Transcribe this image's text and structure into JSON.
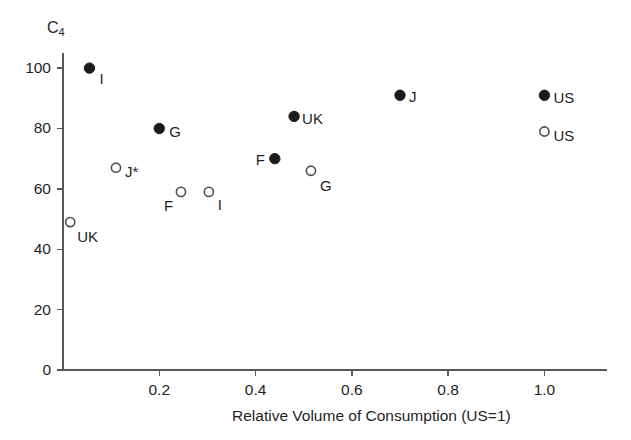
{
  "chart_data": {
    "type": "scatter",
    "title": "",
    "xlabel": "Relative Volume of Consumption (US=1)",
    "ylabel": "C4",
    "ylabel_display": "C",
    "ylabel_subscript": "4",
    "xlim": [
      0,
      1.13
    ],
    "ylim": [
      0,
      105
    ],
    "xticks": [
      0.2,
      0.4,
      0.6,
      0.8,
      1.0
    ],
    "xtick_labels": [
      "0.2",
      "0.4",
      "0.6",
      "0.8",
      "1.0"
    ],
    "yticks": [
      0,
      20,
      40,
      60,
      80,
      100
    ],
    "ytick_labels": [
      "0",
      "20",
      "40",
      "60",
      "80",
      "100"
    ],
    "grid": false,
    "legend": "none",
    "marker_styles": [
      "filled",
      "open"
    ],
    "points": [
      {
        "label": "I",
        "x": 0.055,
        "y": 100,
        "marker": "filled",
        "label_dx": 10,
        "label_dy": 3
      },
      {
        "label": "G",
        "x": 0.2,
        "y": 80,
        "marker": "filled",
        "label_dx": 10,
        "label_dy": -4
      },
      {
        "label": "UK",
        "x": 0.48,
        "y": 84,
        "marker": "filled",
        "label_dx": 8,
        "label_dy": -5
      },
      {
        "label": "J",
        "x": 0.7,
        "y": 91,
        "marker": "filled",
        "label_dx": 9,
        "label_dy": -6
      },
      {
        "label": "US",
        "x": 1.0,
        "y": 91,
        "marker": "filled",
        "label_dx": 9,
        "label_dy": -5
      },
      {
        "label": "F",
        "x": 0.44,
        "y": 70,
        "marker": "filled",
        "label_dx": -19,
        "label_dy": -7
      },
      {
        "label": "J*",
        "x": 0.11,
        "y": 67,
        "marker": "open",
        "label_dx": 9,
        "label_dy": -4
      },
      {
        "label": "UK",
        "x": 0.015,
        "y": 49,
        "marker": "open",
        "label_dx": 7,
        "label_dy": 7
      },
      {
        "label": "F",
        "x": 0.245,
        "y": 59,
        "marker": "open",
        "label_dx": -17,
        "label_dy": 6
      },
      {
        "label": "I",
        "x": 0.303,
        "y": 59,
        "marker": "open",
        "label_dx": 9,
        "label_dy": 5
      },
      {
        "label": "G",
        "x": 0.515,
        "y": 66,
        "marker": "open",
        "label_dx": 9,
        "label_dy": 7
      },
      {
        "label": "US",
        "x": 1.0,
        "y": 79,
        "marker": "open",
        "label_dx": 9,
        "label_dy": -3
      }
    ]
  }
}
